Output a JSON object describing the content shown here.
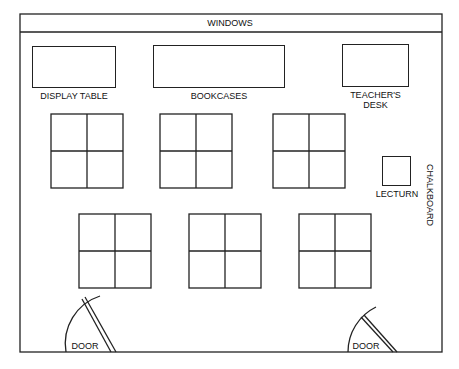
{
  "labels": {
    "windows": "WINDOWS",
    "display_table": "DISPLAY TABLE",
    "bookcases": "BOOKCASES",
    "teachers_desk_line1": "TEACHER'S",
    "teachers_desk_line2": "DESK",
    "lecturn": "LECTURN",
    "chalkboard": "CHALKBOARD",
    "door_left": "DOOR",
    "door_right": "DOOR"
  },
  "desk_groups": {
    "row1": [
      {
        "x": 51,
        "y": 114
      },
      {
        "x": 160,
        "y": 114
      },
      {
        "x": 273,
        "y": 114
      }
    ],
    "row2": [
      {
        "x": 79,
        "y": 214
      },
      {
        "x": 189,
        "y": 214
      },
      {
        "x": 299,
        "y": 214
      }
    ],
    "desks_per_group": 4
  },
  "colors": {
    "line": "#222222",
    "background": "#ffffff"
  }
}
